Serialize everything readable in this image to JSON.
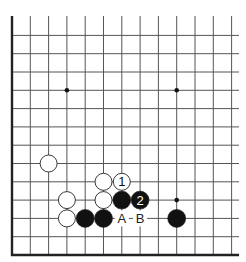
{
  "diagram": {
    "type": "go-board-fragment",
    "board": {
      "columns_visible": 13,
      "rows_visible": 13,
      "edges": [
        "left",
        "bottom"
      ],
      "line_color": "#555555",
      "edge_color": "#222222",
      "background": "#ffffff"
    },
    "star_points": [
      {
        "col": 3,
        "row": 9
      },
      {
        "col": 9,
        "row": 9
      },
      {
        "col": 9,
        "row": 3
      }
    ],
    "stones": [
      {
        "color": "white",
        "col": 2,
        "row": 5,
        "label": ""
      },
      {
        "color": "white",
        "col": 5,
        "row": 4,
        "label": ""
      },
      {
        "color": "white",
        "col": 6,
        "row": 4,
        "label": "1"
      },
      {
        "color": "white",
        "col": 3,
        "row": 3,
        "label": ""
      },
      {
        "color": "white",
        "col": 5,
        "row": 3,
        "label": ""
      },
      {
        "color": "black",
        "col": 6,
        "row": 3,
        "label": ""
      },
      {
        "color": "black",
        "col": 7,
        "row": 3,
        "label": "2"
      },
      {
        "color": "white",
        "col": 3,
        "row": 2,
        "label": ""
      },
      {
        "color": "black",
        "col": 4,
        "row": 2,
        "label": ""
      },
      {
        "color": "black",
        "col": 5,
        "row": 2,
        "label": ""
      },
      {
        "color": "black",
        "col": 9,
        "row": 2,
        "label": ""
      }
    ],
    "point_labels": [
      {
        "text": "A",
        "col": 6,
        "row": 2
      },
      {
        "text": "B",
        "col": 7,
        "row": 2
      }
    ],
    "colors": {
      "black_stone": "#111111",
      "white_stone": "#ffffff",
      "stone_outline": "#222222"
    }
  }
}
